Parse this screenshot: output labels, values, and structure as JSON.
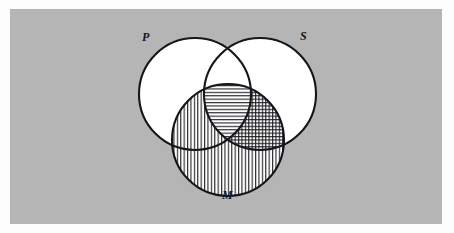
{
  "figure": {
    "type": "venn-diagram",
    "title": "",
    "background_color": "#b5b5b5",
    "page_color": "#fdfdfd",
    "stroke_color": "#15161a",
    "fill_color": "#ffffff"
  },
  "labels": {
    "p": "P",
    "s": "S",
    "m": "M"
  },
  "circles": [
    {
      "id": "P",
      "label": "P",
      "cx": 195,
      "cy": 94,
      "r": 56,
      "label_x": 142,
      "label_y": 30
    },
    {
      "id": "S",
      "label": "S",
      "cx": 260,
      "cy": 94,
      "r": 56,
      "label_x": 300,
      "label_y": 29
    },
    {
      "id": "M",
      "label": "M",
      "cx": 228,
      "cy": 140,
      "r": 56,
      "label_x": 222,
      "label_y": 188
    }
  ],
  "regions": [
    {
      "id": "P-only",
      "sets": [
        "P"
      ],
      "shading": "none"
    },
    {
      "id": "S-only",
      "sets": [
        "S"
      ],
      "shading": "none"
    },
    {
      "id": "M-only",
      "sets": [
        "M"
      ],
      "shading": "vertical"
    },
    {
      "id": "P-and-S",
      "sets": [
        "P",
        "S"
      ],
      "shading": "none"
    },
    {
      "id": "P-and-M",
      "sets": [
        "P",
        "M"
      ],
      "shading": "vertical"
    },
    {
      "id": "S-and-M",
      "sets": [
        "S",
        "M"
      ],
      "shading": "cross-hatch"
    },
    {
      "id": "P-and-S-and-M",
      "sets": [
        "P",
        "S",
        "M"
      ],
      "shading": "horizontal"
    }
  ],
  "legend": {
    "vertical_pattern": "vertical-hatch",
    "horizontal_pattern": "horizontal-hatch",
    "cross_pattern": "cross-hatch"
  }
}
